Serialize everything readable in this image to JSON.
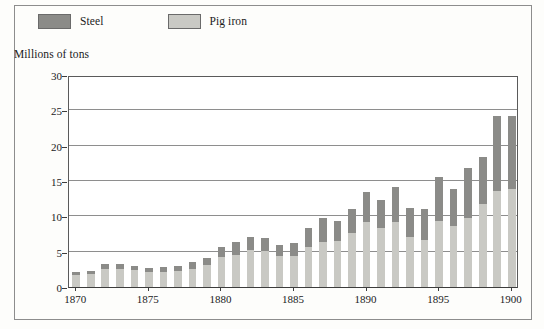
{
  "figure": {
    "axis_title": "Millions of tons",
    "legend": [
      {
        "label": "Steel",
        "color": "#8b8b88",
        "icon": "legend-swatch-steel"
      },
      {
        "label": "Pig iron",
        "color": "#c9c9c4",
        "icon": "legend-swatch-pig-iron"
      }
    ]
  },
  "chart_data": {
    "type": "bar",
    "stacked": true,
    "title": "",
    "subtitle": "",
    "xlabel": "",
    "ylabel": "Millions of tons",
    "ylim": [
      0,
      30
    ],
    "ytick_values": [
      0,
      5,
      10,
      15,
      20,
      25,
      30
    ],
    "ytick_labels": [
      "0",
      "5",
      "10",
      "15",
      "20",
      "25",
      "30"
    ],
    "grid": true,
    "legend_position": "top-left",
    "xtick_values": [
      1870,
      1875,
      1880,
      1885,
      1890,
      1895,
      1900
    ],
    "xtick_labels": [
      "1870",
      "1875",
      "1880",
      "1885",
      "1890",
      "1895",
      "1900"
    ],
    "categories": [
      "1870",
      "1871",
      "1872",
      "1873",
      "1874",
      "1875",
      "1876",
      "1877",
      "1878",
      "1879",
      "1880",
      "1881",
      "1882",
      "1883",
      "1884",
      "1885",
      "1886",
      "1887",
      "1888",
      "1889",
      "1890",
      "1891",
      "1892",
      "1893",
      "1894",
      "1895",
      "1896",
      "1897",
      "1898",
      "1899",
      "1900"
    ],
    "series": [
      {
        "name": "Pig iron",
        "color": "#c9c9c4",
        "values": [
          1.7,
          1.9,
          2.6,
          2.6,
          2.4,
          2.1,
          2.1,
          2.3,
          2.6,
          3.1,
          4.3,
          4.6,
          5.2,
          5.1,
          4.4,
          4.4,
          5.7,
          6.4,
          6.5,
          7.6,
          9.2,
          8.3,
          9.2,
          7.1,
          6.6,
          9.4,
          8.6,
          9.7,
          11.8,
          13.6,
          13.8
        ]
      },
      {
        "name": "Steel",
        "color": "#8b8b88",
        "values": [
          0.4,
          0.4,
          0.6,
          0.7,
          0.6,
          0.6,
          0.7,
          0.7,
          0.9,
          1.0,
          1.4,
          1.8,
          1.9,
          1.8,
          1.6,
          1.8,
          2.6,
          3.4,
          2.9,
          3.4,
          4.3,
          4.0,
          4.9,
          4.1,
          4.4,
          6.2,
          5.3,
          7.2,
          6.6,
          10.6,
          10.4
        ]
      }
    ],
    "totals": [
      2.1,
      2.3,
      3.2,
      3.3,
      3.0,
      2.7,
      2.8,
      3.0,
      3.5,
      4.1,
      5.7,
      6.4,
      7.1,
      6.9,
      6.0,
      6.2,
      8.3,
      9.8,
      9.4,
      11.0,
      13.5,
      12.3,
      14.1,
      11.2,
      11.0,
      15.6,
      13.9,
      16.9,
      18.4,
      24.2,
      24.2
    ]
  }
}
